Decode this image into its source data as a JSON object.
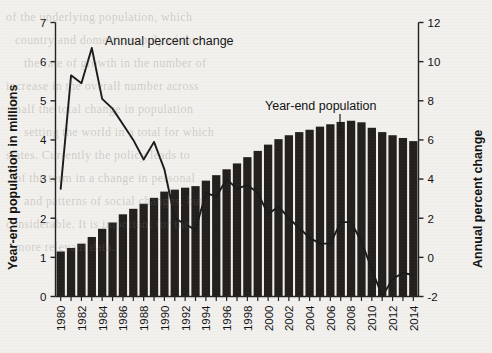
{
  "chart_data": {
    "type": "bar",
    "title": "",
    "subtitle": "",
    "xlabel": "",
    "ylabel": "Year-end population in millions",
    "y2label": "Annual percent change",
    "ylim": [
      0,
      7
    ],
    "y2lim": [
      -2,
      12
    ],
    "grid": false,
    "legend_position": "inside-annotations",
    "x": [
      1980,
      1981,
      1982,
      1983,
      1984,
      1985,
      1986,
      1987,
      1988,
      1989,
      1990,
      1991,
      1992,
      1993,
      1994,
      1995,
      1996,
      1997,
      1998,
      1999,
      2000,
      2001,
      2002,
      2003,
      2004,
      2005,
      2006,
      2007,
      2008,
      2009,
      2010,
      2011,
      2012,
      2013,
      2014
    ],
    "xtick_labels": [
      "1980",
      "1982",
      "1984",
      "1986",
      "1988",
      "1990",
      "1992",
      "1994",
      "1996",
      "1998",
      "2000",
      "2002",
      "2004",
      "2006",
      "2008",
      "2010",
      "2012",
      "2014"
    ],
    "ytick_labels": [
      "0",
      "1",
      "2",
      "3",
      "4",
      "5",
      "6",
      "7"
    ],
    "y2tick_labels": [
      "-2",
      "0",
      "2",
      "4",
      "6",
      "8",
      "10",
      "12"
    ],
    "series": [
      {
        "name": "Year-end population",
        "type": "bar",
        "axis": "left",
        "unit": "millions",
        "color": "#231f1d",
        "values": [
          1.15,
          1.24,
          1.35,
          1.52,
          1.73,
          1.89,
          2.1,
          2.24,
          2.37,
          2.52,
          2.68,
          2.73,
          2.78,
          2.82,
          2.96,
          3.1,
          3.25,
          3.4,
          3.56,
          3.72,
          3.88,
          4.02,
          4.12,
          4.2,
          4.26,
          4.34,
          4.4,
          4.46,
          4.49,
          4.45,
          4.31,
          4.2,
          4.12,
          4.05,
          3.97
        ]
      },
      {
        "name": "Annual percent change",
        "type": "line",
        "axis": "right",
        "unit": "percent",
        "color": "#1a1a1a",
        "values": [
          3.5,
          9.3,
          8.9,
          10.7,
          8.1,
          7.6,
          6.8,
          6.0,
          5.0,
          5.9,
          4.5,
          2.0,
          1.7,
          1.4,
          3.3,
          3.1,
          4.0,
          3.5,
          3.7,
          3.3,
          2.2,
          2.6,
          2.0,
          1.5,
          1.0,
          0.7,
          0.7,
          1.8,
          1.8,
          0.8,
          -0.6,
          -2.0,
          -1.1,
          -0.8,
          -0.9
        ]
      }
    ],
    "annotations": [
      {
        "name": "annual-percent-change-label",
        "text": "Annual percent change",
        "x_px": 105,
        "y_px": 45
      },
      {
        "name": "year-end-population-label",
        "text": "Year-end population",
        "x_px": 265,
        "y_px": 110
      }
    ]
  },
  "ghost_text": {
    "lines": [
      "of the underlying population, which",
      "country and domestic supply of the",
      "the rate of growth in the number of",
      "increase in the overall number across",
      "half the total change in population",
      "setting the world in a total for which",
      "states. Currently the policy leads to",
      "of the term in a change in personal",
      "and patterns of social changes, but",
      "considerable. It is important for the",
      "more relevant data."
    ]
  }
}
